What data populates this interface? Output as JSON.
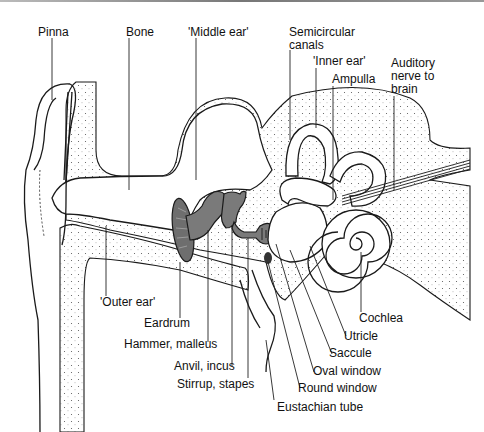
{
  "figure": {
    "regions": {
      "outer": "'Outer ear'",
      "middle": "'Middle ear'",
      "inner": "'Inner ear'"
    },
    "labels": {
      "pinna": "Pinna",
      "bone": "Bone",
      "middle_ear": "'Middle ear'",
      "semicircular_1": "Semicircular",
      "semicircular_2": "canals",
      "inner_ear": "'Inner ear'",
      "ampulla": "Ampulla",
      "auditory_1": "Auditory",
      "auditory_2": "nerve to",
      "auditory_3": "brain",
      "outer_ear": "'Outer ear'",
      "eardrum": "Eardrum",
      "hammer": "Hammer, malleus",
      "anvil": "Anvil, incus",
      "stirrup": "Stirrup, stapes",
      "cochlea": "Cochlea",
      "utricle": "Utricle",
      "saccule": "Saccule",
      "oval_window": "Oval window",
      "round_window": "Round window",
      "eustachian": "Eustachian tube"
    },
    "colors": {
      "line": "#1a1a1a",
      "ossicle_fill": "#7a7a7a",
      "background": "#ffffff"
    }
  }
}
